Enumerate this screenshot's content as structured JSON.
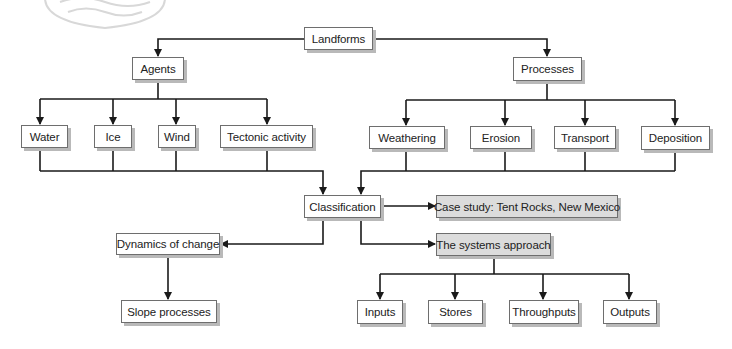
{
  "diagram": {
    "title": "Landforms",
    "nodes": {
      "landforms": {
        "label": "Landforms",
        "x": 304,
        "y": 27,
        "w": 69,
        "h": 23,
        "shaded": false
      },
      "agents": {
        "label": "Agents",
        "x": 132,
        "y": 57,
        "w": 52,
        "h": 23,
        "shaded": false
      },
      "processes": {
        "label": "Processes",
        "x": 513,
        "y": 57,
        "w": 69,
        "h": 24,
        "shaded": false
      },
      "water": {
        "label": "Water",
        "x": 21,
        "y": 125,
        "w": 47,
        "h": 23,
        "shaded": false
      },
      "ice": {
        "label": "Ice",
        "x": 94,
        "y": 125,
        "w": 38,
        "h": 23,
        "shaded": false
      },
      "wind": {
        "label": "Wind",
        "x": 158,
        "y": 125,
        "w": 38,
        "h": 23,
        "shaded": false
      },
      "tectonic": {
        "label": "Tectonic activity",
        "x": 220,
        "y": 125,
        "w": 93,
        "h": 23,
        "shaded": false
      },
      "weathering": {
        "label": "Weathering",
        "x": 369,
        "y": 126,
        "w": 76,
        "h": 23,
        "shaded": false
      },
      "erosion": {
        "label": "Erosion",
        "x": 470,
        "y": 126,
        "w": 62,
        "h": 23,
        "shaded": false
      },
      "transport": {
        "label": "Transport",
        "x": 554,
        "y": 126,
        "w": 62,
        "h": 23,
        "shaded": false
      },
      "deposition": {
        "label": "Deposition",
        "x": 641,
        "y": 126,
        "w": 69,
        "h": 24,
        "shaded": false
      },
      "classification": {
        "label": "Classification",
        "x": 304,
        "y": 195,
        "w": 77,
        "h": 23,
        "shaded": false
      },
      "case_study": {
        "label": "Case study: Tent Rocks, New Mexico",
        "x": 436,
        "y": 195,
        "w": 182,
        "h": 23,
        "shaded": true
      },
      "dynamics": {
        "label": "Dynamics of change",
        "x": 116,
        "y": 233,
        "w": 104,
        "h": 22,
        "shaded": false
      },
      "systems": {
        "label": "The systems approach",
        "x": 436,
        "y": 233,
        "w": 115,
        "h": 23,
        "shaded": true
      },
      "slope": {
        "label": "Slope processes",
        "x": 121,
        "y": 300,
        "w": 96,
        "h": 23,
        "shaded": false
      },
      "inputs": {
        "label": "Inputs",
        "x": 357,
        "y": 300,
        "w": 46,
        "h": 24,
        "shaded": false
      },
      "stores": {
        "label": "Stores",
        "x": 428,
        "y": 300,
        "w": 55,
        "h": 24,
        "shaded": false
      },
      "throughputs": {
        "label": "Throughputs",
        "x": 509,
        "y": 300,
        "w": 70,
        "h": 24,
        "shaded": false
      },
      "outputs": {
        "label": "Outputs",
        "x": 603,
        "y": 300,
        "w": 54,
        "h": 24,
        "shaded": false
      }
    },
    "edges": [
      {
        "from": "landforms",
        "to": "agents"
      },
      {
        "from": "landforms",
        "to": "processes"
      },
      {
        "from": "agents",
        "to": "water"
      },
      {
        "from": "agents",
        "to": "ice"
      },
      {
        "from": "agents",
        "to": "wind"
      },
      {
        "from": "agents",
        "to": "tectonic"
      },
      {
        "from": "processes",
        "to": "weathering"
      },
      {
        "from": "processes",
        "to": "erosion"
      },
      {
        "from": "processes",
        "to": "transport"
      },
      {
        "from": "processes",
        "to": "deposition"
      },
      {
        "from": "water,ice,wind,tectonic",
        "to": "classification"
      },
      {
        "from": "weathering,erosion,transport,deposition",
        "to": "classification"
      },
      {
        "from": "classification",
        "to": "case_study"
      },
      {
        "from": "classification",
        "to": "dynamics"
      },
      {
        "from": "classification",
        "to": "systems"
      },
      {
        "from": "dynamics",
        "to": "slope"
      },
      {
        "from": "systems",
        "to": "inputs"
      },
      {
        "from": "systems",
        "to": "stores"
      },
      {
        "from": "systems",
        "to": "throughputs"
      },
      {
        "from": "systems",
        "to": "outputs"
      }
    ],
    "colors": {
      "line": "#1a1a1a",
      "box_border": "#6e6e6e",
      "box_shadow": "#b9b9b9",
      "shaded_fill": "#dcdcdc",
      "watermark": "#d8d8d8"
    }
  }
}
